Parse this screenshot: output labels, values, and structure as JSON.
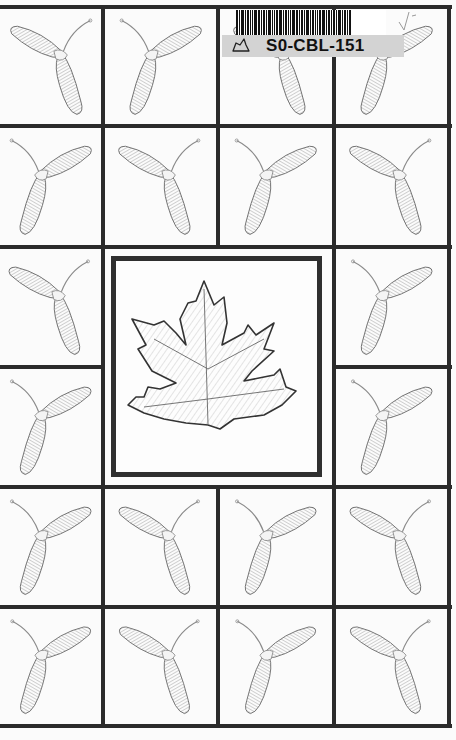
{
  "page": {
    "type": "coloring-book-cover",
    "background_color": "#fbfbfb",
    "line_color": "#2b2b2b"
  },
  "sticker": {
    "code": "S0-CBL-151",
    "barcode_icon": "barcode-icon",
    "leaf_icon": "leaf-outline-icon",
    "strip_color": "#d3d3d3"
  },
  "annotation": {
    "mark": "checkmark-icon"
  },
  "center": {
    "illustration": "maple-leaf-icon",
    "frame_color": "#2f2f2f"
  },
  "grid": {
    "columns": 4,
    "rows": 6,
    "cell_illustration": "maple-seed-icon",
    "orientations": [
      [
        "left",
        "right",
        "left",
        "right"
      ],
      [
        "left",
        "right",
        "left",
        "right"
      ],
      [
        "left",
        null,
        null,
        "left"
      ],
      [
        "left",
        null,
        null,
        "left"
      ],
      [
        "left",
        "right",
        "left",
        "right"
      ],
      [
        "left",
        "right",
        "left",
        "right"
      ]
    ]
  }
}
